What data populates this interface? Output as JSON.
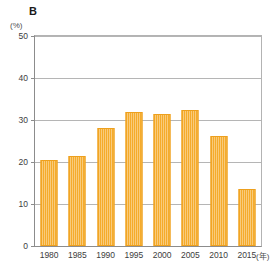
{
  "figure": {
    "panel_label": "B",
    "y_unit": "(%)",
    "x_unit": "(年)",
    "bar_color": "#f5ab2b",
    "bar_edge_color": "#eda01e",
    "grid_color": "#b5b5b5",
    "axis_color": "#8c8c8c"
  },
  "chart_data": {
    "type": "bar",
    "title": "B",
    "xlabel": "(年)",
    "ylabel": "(%)",
    "categories": [
      "1980",
      "1985",
      "1990",
      "1995",
      "2000",
      "2005",
      "2010",
      "2015"
    ],
    "values": [
      20.5,
      21.5,
      28.0,
      31.8,
      31.5,
      32.3,
      26.2,
      13.5
    ],
    "ylim": [
      0,
      50
    ],
    "yticks": [
      0,
      10,
      20,
      30,
      40,
      50
    ],
    "ytick_labels": [
      "0",
      "10",
      "20",
      "30",
      "40",
      "50"
    ],
    "grid": true,
    "grid_axis": "y",
    "legend": false,
    "series": [
      {
        "name": "B",
        "values": [
          20.5,
          21.5,
          28.0,
          31.8,
          31.5,
          32.3,
          26.2,
          13.5
        ]
      }
    ]
  }
}
